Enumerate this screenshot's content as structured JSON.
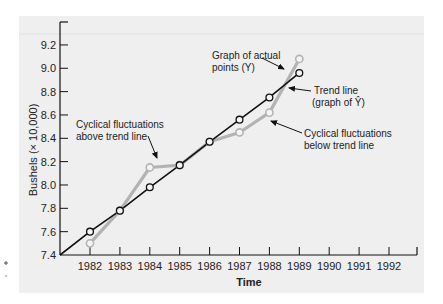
{
  "chart_data": {
    "type": "line",
    "title": "",
    "xlabel": "Time",
    "ylabel": "Bushels (× 10,000)",
    "ylim": [
      7.4,
      9.3
    ],
    "yticks": [
      "7.4",
      "7.6",
      "7.8",
      "8.0",
      "8.2",
      "8.4",
      "8.6",
      "8.8",
      "9.0",
      "9.2"
    ],
    "x_tick_labels": [
      "1982",
      "1983",
      "1984",
      "1985",
      "1986",
      "1987",
      "1988",
      "1989",
      "1990",
      "1991",
      "1992"
    ],
    "grid": false,
    "series": [
      {
        "name": "Graph of actual points (Y)",
        "color": "#b3b3b3",
        "x": [
          1982,
          1983,
          1984,
          1985,
          1986,
          1987,
          1988,
          1989
        ],
        "values": [
          7.5,
          7.78,
          8.15,
          8.17,
          8.37,
          8.45,
          8.62,
          9.08
        ]
      },
      {
        "name": "Trend line (graph of Ŷ)",
        "color": "#111111",
        "x": [
          1982,
          1983,
          1984,
          1985,
          1986,
          1987,
          1988,
          1989
        ],
        "values": [
          7.6,
          7.78,
          7.98,
          8.17,
          8.37,
          8.56,
          8.75,
          8.96
        ]
      }
    ],
    "annotations": [
      {
        "id": "actual",
        "lines": [
          "Graph of actual",
          "points (Y)"
        ]
      },
      {
        "id": "trend",
        "lines": [
          "Trend line",
          "(graph of Ŷ)"
        ]
      },
      {
        "id": "above",
        "lines": [
          "Cyclical fluctuations",
          "above trend line"
        ]
      },
      {
        "id": "below",
        "lines": [
          "Cyclical fluctuations",
          "below trend line"
        ]
      }
    ]
  },
  "labels": {
    "xlabel": "Time",
    "ylabel": "Bushels (× 10,000)",
    "anno_actual_1": "Graph of actual",
    "anno_actual_2": "points (Y)",
    "anno_trend_1": "Trend line",
    "anno_trend_2": "(graph of Ŷ)",
    "anno_above_1": "Cyclical fluctuations",
    "anno_above_2": "above trend line",
    "anno_below_1": "Cyclical fluctuations",
    "anno_below_2": "below trend line"
  }
}
